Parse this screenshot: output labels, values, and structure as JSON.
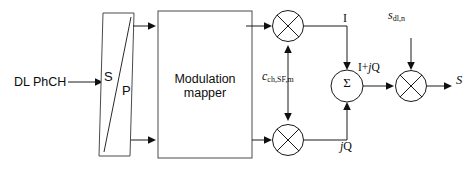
{
  "diagram": {
    "type": "block-diagram",
    "colors": {
      "line": "#1a1a1a",
      "box_stroke": "#4a4a4a",
      "background": "#ffffff",
      "text": "#0d0d0d"
    },
    "input": {
      "label": "DL PhCH"
    },
    "serial_parallel": {
      "serial_label": "S",
      "parallel_label": "P"
    },
    "modulation_mapper": {
      "line1": "Modulation",
      "line2": "mapper"
    },
    "spreading_code": {
      "symbol": "c",
      "subscript": "ch,SF,m"
    },
    "scrambling_code": {
      "symbol": "s",
      "subscript": "dl,n"
    },
    "branches": {
      "i_label": "I",
      "jq_label": "jQ",
      "jq_italic_part": "j",
      "jq_plain_part": "Q"
    },
    "summer": {
      "symbol": "Σ",
      "output_label_plain_1": "I+",
      "output_label_italic": "j",
      "output_label_plain_2": "Q"
    },
    "output": {
      "label": "S"
    },
    "multipliers": {
      "symbol": "⊗",
      "count": 3,
      "names": [
        "i-branch-multiplier",
        "q-branch-multiplier",
        "scrambling-multiplier"
      ]
    }
  }
}
